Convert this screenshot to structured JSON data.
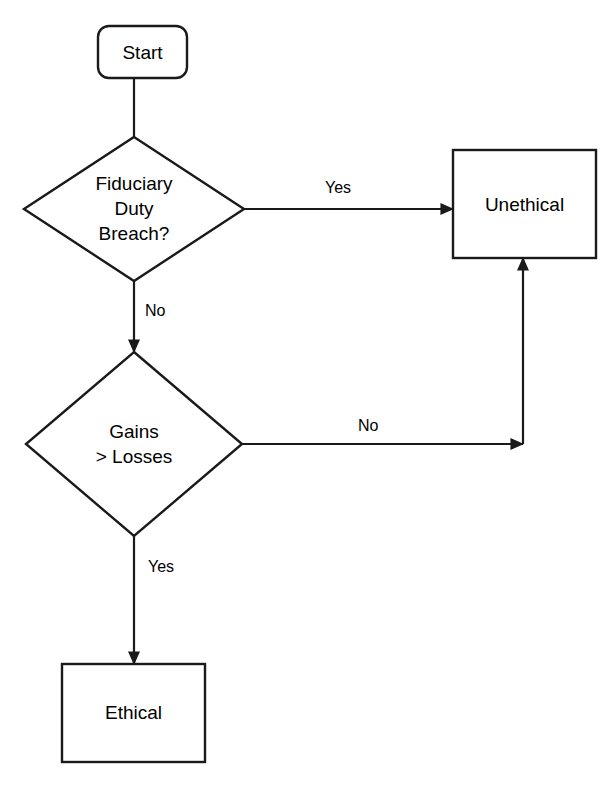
{
  "diagram": {
    "type": "flowchart",
    "stroke_color": "#1a1a1a",
    "fill_color": "#ffffff",
    "text_color": "#000000",
    "background": "#ffffff"
  },
  "nodes": [
    {
      "id": "start",
      "shape": "rounded-rectangle",
      "label": "Start",
      "x": 98,
      "y": 26,
      "width": 89,
      "height": 52
    },
    {
      "id": "fiduciary_decision",
      "shape": "diamond",
      "label": "Fiduciary\nDuty\nBreach?",
      "cx": 134,
      "cy": 209,
      "half_width": 110,
      "half_height": 72
    },
    {
      "id": "unethical",
      "shape": "rectangle",
      "label": "Unethical",
      "x": 453,
      "y": 150,
      "width": 143,
      "height": 108
    },
    {
      "id": "gains_decision",
      "shape": "diamond",
      "label": "Gains\n> Losses",
      "cx": 134,
      "cy": 444,
      "half_width": 108,
      "half_height": 92
    },
    {
      "id": "ethical",
      "shape": "rectangle",
      "label": "Ethical",
      "x": 62,
      "y": 664,
      "width": 143,
      "height": 98
    }
  ],
  "edges": [
    {
      "id": "start-to-fiduciary",
      "from": "start",
      "to": "fiduciary_decision",
      "label": "",
      "arrowhead": false
    },
    {
      "id": "fiduciary-yes-to-unethical",
      "from": "fiduciary_decision",
      "to": "unethical",
      "label": "Yes",
      "label_x": 325,
      "label_y": 179,
      "arrowhead": true
    },
    {
      "id": "fiduciary-no-to-gains",
      "from": "fiduciary_decision",
      "to": "gains_decision",
      "label": "No",
      "label_x": 145,
      "label_y": 302,
      "arrowhead": true
    },
    {
      "id": "gains-no-to-unethical",
      "from": "gains_decision",
      "to": "unethical",
      "label": "No",
      "label_x": 358,
      "label_y": 417,
      "arrowhead": true
    },
    {
      "id": "gains-yes-to-ethical",
      "from": "gains_decision",
      "to": "ethical",
      "label": "Yes",
      "label_x": 148,
      "label_y": 558,
      "arrowhead": true
    }
  ]
}
